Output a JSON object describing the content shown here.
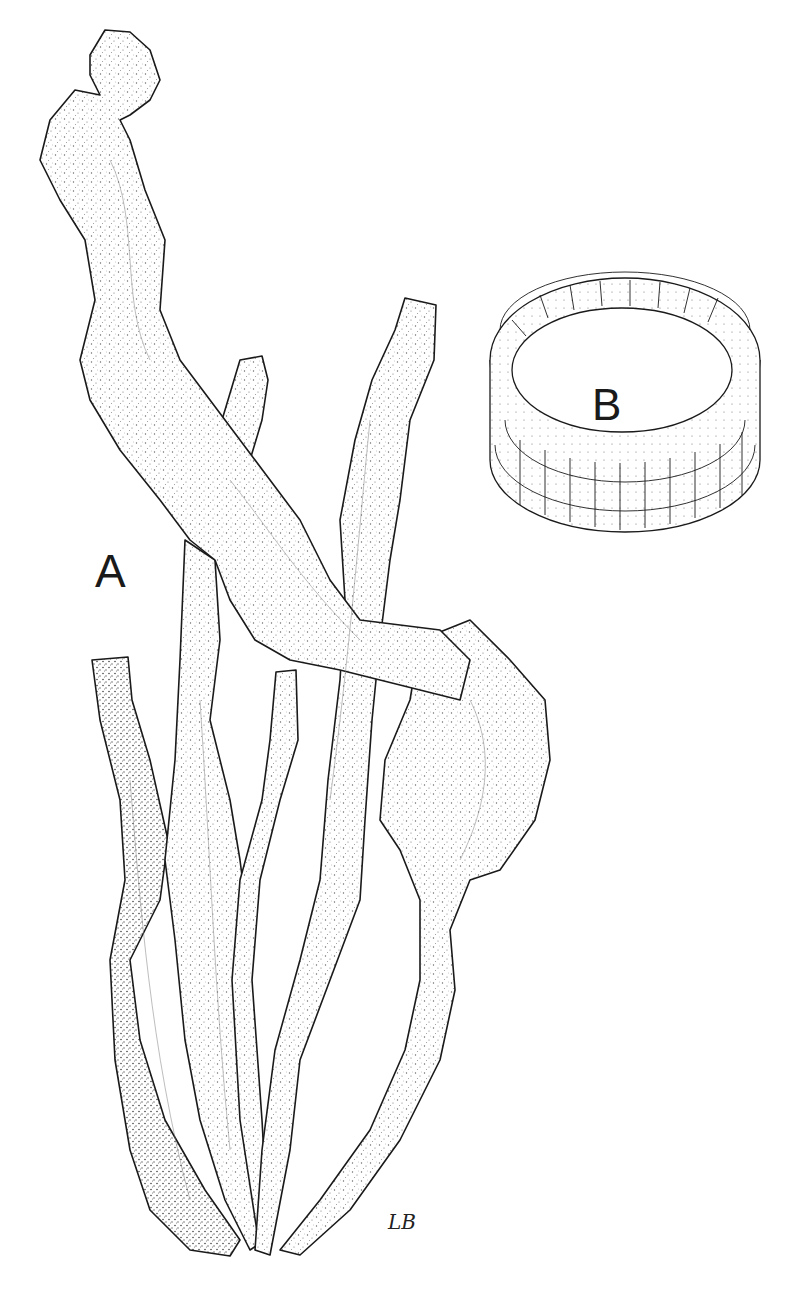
{
  "figure": {
    "panels": [
      {
        "id": "A",
        "label": "A",
        "subject": "whole thallus with several tubular, ruffled fronds from a common base"
      },
      {
        "id": "B",
        "label": "B",
        "subject": "cross-section ring of cells showing single-layer tubular wall"
      }
    ],
    "signature": "LB",
    "colors": {
      "ink": "#1a1a1a",
      "paper": "#ffffff",
      "stipple": "#555555"
    }
  }
}
